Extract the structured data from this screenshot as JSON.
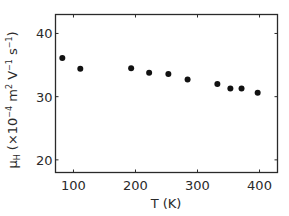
{
  "chart_data": {
    "type": "scatter",
    "title": "",
    "xlabel": "T (K)",
    "ylabel": "μH (×10⁻⁴ m² V⁻¹ s⁻¹)",
    "ylabel_parts": {
      "symbol": "μ",
      "subscript": "H",
      "open": " (×10",
      "exp1": "−4",
      "unit_m": " m",
      "exp2": "2",
      "unit_v": " V",
      "exp3": "−1",
      "unit_s": " s",
      "exp4": "−1",
      "close": ")"
    },
    "xlim": [
      71,
      429
    ],
    "ylim": [
      18,
      43
    ],
    "x_ticks": [
      100,
      200,
      300,
      400
    ],
    "x_tick_labels": [
      "100",
      "200",
      "300",
      "400"
    ],
    "y_ticks": [
      20,
      30,
      40
    ],
    "y_tick_labels": [
      "20",
      "30",
      "40"
    ],
    "grid": false,
    "legend": null,
    "series": [
      {
        "name": "Hall mobility",
        "marker": "filled-circle",
        "color": "#111111",
        "x": [
          82,
          111,
          193,
          222,
          253,
          284,
          332,
          353,
          371,
          397
        ],
        "y": [
          36.1,
          34.4,
          34.5,
          33.8,
          33.6,
          32.7,
          32.0,
          31.3,
          31.3,
          30.6
        ]
      }
    ]
  },
  "colors": {
    "axis": "#2a2a2a",
    "marker": "#111111",
    "background": "#ffffff"
  }
}
